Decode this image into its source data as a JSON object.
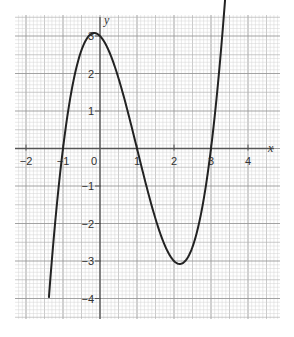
{
  "chart_data": {
    "type": "line",
    "title": "",
    "xlabel": "x",
    "ylabel": "y",
    "xlim": [
      -2.3,
      4.85
    ],
    "ylim": [
      -4.7,
      3.55
    ],
    "x_ticks": [
      -2,
      -1,
      0,
      1,
      2,
      3,
      4
    ],
    "x_tick_labels": [
      "-2",
      "-1",
      "0",
      "1",
      "2",
      "3",
      "4"
    ],
    "y_ticks": [
      -4,
      -3,
      -2,
      -1,
      1,
      2,
      3
    ],
    "y_tick_labels": [
      "-4",
      "-3",
      "-2",
      "-1",
      "1",
      "2",
      "3"
    ],
    "grid": true,
    "grid_minor_step": 0.1,
    "legend": null,
    "series": [
      {
        "name": "y = x^3 - 3x^2 - x + 3",
        "color": "#222222",
        "x_range": [
          -1.38,
          3.43
        ],
        "coefficients": [
          1,
          -3,
          -1,
          3
        ],
        "key_points": [
          {
            "x": -1.38,
            "y": -4.0
          },
          {
            "x": -1,
            "y": 0
          },
          {
            "x": 0,
            "y": 3
          },
          {
            "x": 1,
            "y": 0
          },
          {
            "x": 2,
            "y": -3
          },
          {
            "x": 3,
            "y": 0
          },
          {
            "x": 3.43,
            "y": 3.2
          }
        ]
      }
    ]
  },
  "layout": {
    "origin_px": [
      100,
      148.5
    ],
    "unit_px_x": 37,
    "unit_px_y": 37.5,
    "grid_box": [
      15,
      15,
      280,
      319
    ],
    "colors": {
      "minor_grid": "#d4d4d4",
      "mid_grid": "#b4b4b4",
      "major_grid": "#999999",
      "axis": "#555555",
      "curve": "#222222"
    }
  }
}
